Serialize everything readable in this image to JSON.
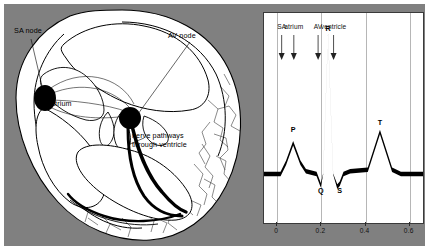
{
  "figure": {
    "background_color": "#808080",
    "panel_background": "#ffffff"
  },
  "heart_diagram": {
    "title": "Conduction system of the heart",
    "labels": {
      "sa_node": "SA node",
      "av_node": "AV node",
      "atrium": "atrium",
      "nerve_pathways_line1": "nerve pathways",
      "nerve_pathways_line2": "through ventricle"
    }
  },
  "chart_data": {
    "type": "line",
    "xlabel": "",
    "ylabel": "",
    "xlim": [
      -0.06,
      0.66
    ],
    "ylim": [
      -0.35,
      1.15
    ],
    "grid": true,
    "legend": null,
    "x_ticks": [
      "0",
      "0.2",
      "0.4",
      "0.6"
    ],
    "x_tick_values": [
      0,
      0.2,
      0.4,
      0.6
    ],
    "phase_annotations": [
      {
        "label": "SA",
        "x": 0.02
      },
      {
        "label": "atrium",
        "x": 0.075
      },
      {
        "label": "AV",
        "x": 0.185
      },
      {
        "label": "ventricle",
        "x": 0.255
      }
    ],
    "wave_annotations": [
      {
        "label": "P",
        "x": 0.072,
        "y": 0.28
      },
      {
        "label": "Q",
        "x": 0.197,
        "y": -0.16
      },
      {
        "label": "R",
        "x": 0.23,
        "y": 1.0
      },
      {
        "label": "S",
        "x": 0.283,
        "y": -0.16
      },
      {
        "label": "T",
        "x": 0.465,
        "y": 0.33
      }
    ],
    "series": [
      {
        "name": "ECG",
        "x": [
          -0.06,
          0.015,
          0.04,
          0.072,
          0.105,
          0.13,
          0.178,
          0.197,
          0.208,
          0.23,
          0.253,
          0.272,
          0.283,
          0.3,
          0.33,
          0.41,
          0.465,
          0.52,
          0.56,
          0.66
        ],
        "y": [
          0.0,
          0.0,
          0.08,
          0.22,
          0.08,
          0.02,
          0.0,
          -0.08,
          0.0,
          1.0,
          0.0,
          -0.09,
          -0.07,
          0.0,
          0.02,
          0.03,
          0.3,
          0.03,
          0.0,
          0.0
        ]
      }
    ]
  }
}
